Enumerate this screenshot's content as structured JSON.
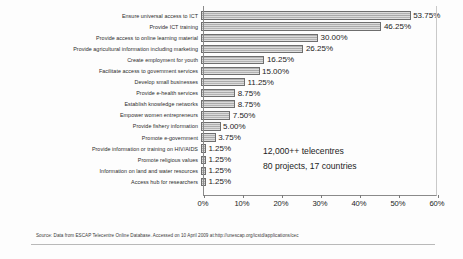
{
  "chart_data": {
    "type": "bar",
    "orientation": "horizontal",
    "title": "",
    "xlabel": "",
    "ylabel": "",
    "xlim": [
      0,
      60
    ],
    "xticks": [
      "0%",
      "10%",
      "20%",
      "30%",
      "40%",
      "50%",
      "60%"
    ],
    "xtick_values": [
      0,
      10,
      20,
      30,
      40,
      50,
      60
    ],
    "grid": false,
    "legend": false,
    "value_suffix": "%",
    "categories": [
      "Ensure universal access to ICT",
      "Provide ICT training",
      "Provide access to online learning material",
      "Provide agricultural information including marketing",
      "Create employment for youth",
      "Facilitate access to government services",
      "Develop small businesses",
      "Provide e-health services",
      "Establish knowledge networks",
      "Empower women entrepreneurs",
      "Provide fishery information",
      "Promote e-government",
      "Provide information or training on HIV/AIDS",
      "Promote religious values",
      "Information on land and water resources",
      "Access hub for researchers"
    ],
    "values": [
      53.75,
      46.25,
      30.0,
      26.25,
      16.25,
      15.0,
      11.25,
      8.75,
      8.75,
      7.5,
      5.0,
      3.75,
      1.25,
      1.25,
      1.25,
      1.25
    ],
    "value_labels": [
      "53.75%",
      "46.25%",
      "30.00%",
      "26.25%",
      "16.25%",
      "15.00%",
      "11.25%",
      "8.75%",
      "8.75%",
      "7.50%",
      "5.00%",
      "3.75%",
      "1.25%",
      "1.25%",
      "1.25%",
      "1.25%"
    ],
    "bar_color": "#b0b0b0",
    "bar_border_color": "#6e6e6e",
    "annotations": [
      "12,000++ telecentres",
      "80 projects, 17 countries"
    ]
  },
  "footer": {
    "source": "Source: Data from ESCAP Telecentre Online Database. Accessed on 10 April 2009 at:http://unescap.org/icstd/applications/cec"
  }
}
